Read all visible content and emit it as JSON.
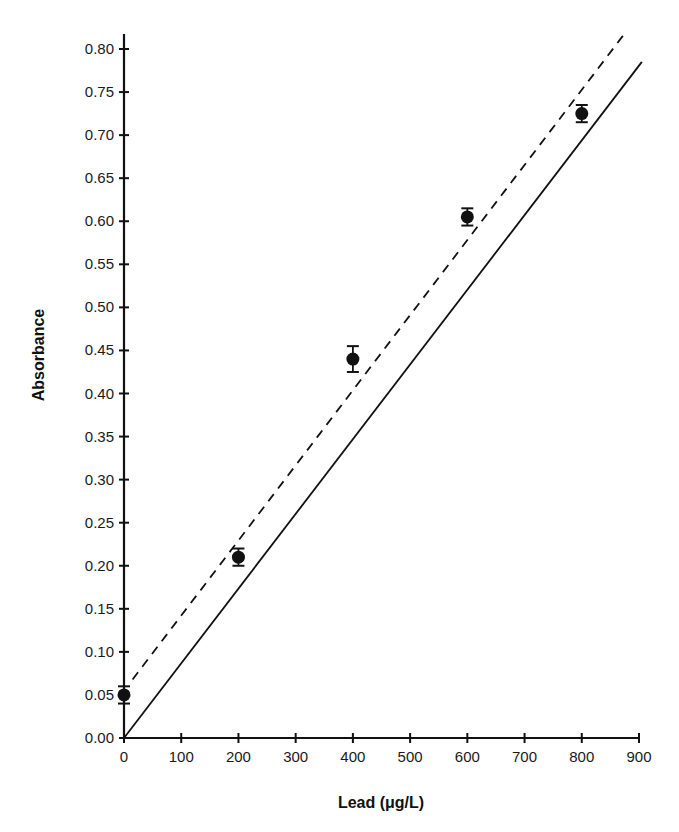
{
  "chart_data": {
    "type": "scatter",
    "title": "",
    "xlabel": "Lead (μg/L)",
    "ylabel": "Absorbance",
    "xlim": [
      0,
      900
    ],
    "ylim": [
      0,
      0.8
    ],
    "x_ticks": [
      0,
      100,
      200,
      300,
      400,
      500,
      600,
      700,
      800,
      900
    ],
    "x_tick_labels": [
      "0",
      "100",
      "200",
      "300",
      "400",
      "500",
      "600",
      "700",
      "800",
      "900"
    ],
    "y_ticks": [
      0.0,
      0.05,
      0.1,
      0.15,
      0.2,
      0.25,
      0.3,
      0.35,
      0.4,
      0.45,
      0.5,
      0.55,
      0.6,
      0.65,
      0.7,
      0.75,
      0.8
    ],
    "y_tick_labels": [
      "0.00",
      "0.05",
      "0.10",
      "0.15",
      "0.20",
      "0.25",
      "0.30",
      "0.35",
      "0.40",
      "0.45",
      "0.50",
      "0.55",
      "0.60",
      "0.65",
      "0.70",
      "0.75",
      "0.80"
    ],
    "grid": false,
    "legend": null,
    "series": [
      {
        "name": "Measured",
        "kind": "points_with_error_bars",
        "x": [
          0,
          200,
          400,
          600,
          800
        ],
        "y": [
          0.05,
          0.21,
          0.44,
          0.605,
          0.725
        ],
        "error": [
          0.01,
          0.01,
          0.015,
          0.01,
          0.01
        ],
        "marker": "filled-circle",
        "color": "#111111"
      },
      {
        "name": "Fit (dashed)",
        "kind": "line",
        "style": "dashed",
        "x": [
          15,
          875
        ],
        "y": [
          0.068,
          0.818
        ],
        "color": "#111111"
      },
      {
        "name": "Ideal (solid)",
        "kind": "line",
        "style": "solid",
        "x": [
          0,
          905
        ],
        "y": [
          0.0,
          0.785
        ],
        "color": "#111111"
      }
    ]
  }
}
